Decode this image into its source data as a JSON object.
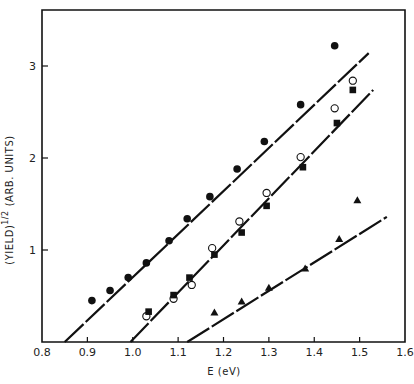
{
  "chart_data": {
    "type": "scatter",
    "title": "",
    "xlabel": "E (eV)",
    "ylabel": "(YIELD)^1/2 (ARB. UNITS)",
    "ylabel_main": "(YIELD)",
    "ylabel_sup": "1/2",
    "ylabel_units": "(ARB. UNITS)",
    "xlim": [
      0.8,
      1.6
    ],
    "ylim": [
      0,
      3.5
    ],
    "x_ticks": [
      "0.8",
      "0.9",
      "1.0",
      "1.1",
      "1.2",
      "1.3",
      "1.4",
      "1.5",
      "1.6"
    ],
    "y_ticks": [
      "1",
      "2",
      "3"
    ],
    "grid": false,
    "legend": "none",
    "series": [
      {
        "name": "filled circles",
        "marker": "filled-circle",
        "points": [
          [
            0.91,
            0.45
          ],
          [
            0.95,
            0.56
          ],
          [
            0.99,
            0.7
          ],
          [
            1.03,
            0.86
          ],
          [
            1.08,
            1.1
          ],
          [
            1.12,
            1.34
          ],
          [
            1.17,
            1.58
          ],
          [
            1.23,
            1.88
          ],
          [
            1.29,
            2.18
          ],
          [
            1.37,
            2.58
          ],
          [
            1.445,
            3.22
          ]
        ],
        "fit_line": [
          [
            0.85,
            0.0
          ],
          [
            1.52,
            3.14
          ]
        ]
      },
      {
        "name": "open circles",
        "marker": "open-circle",
        "points": [
          [
            1.03,
            0.28
          ],
          [
            1.09,
            0.47
          ],
          [
            1.13,
            0.62
          ],
          [
            1.175,
            1.02
          ],
          [
            1.235,
            1.31
          ],
          [
            1.295,
            1.62
          ],
          [
            1.37,
            2.01
          ],
          [
            1.445,
            2.54
          ],
          [
            1.485,
            2.84
          ]
        ],
        "fit_line": [
          [
            0.995,
            0.0
          ],
          [
            1.53,
            2.74
          ]
        ]
      },
      {
        "name": "filled squares",
        "marker": "filled-square",
        "points": [
          [
            1.035,
            0.33
          ],
          [
            1.09,
            0.51
          ],
          [
            1.125,
            0.7
          ],
          [
            1.18,
            0.95
          ],
          [
            1.24,
            1.19
          ],
          [
            1.295,
            1.48
          ],
          [
            1.375,
            1.9
          ],
          [
            1.45,
            2.38
          ],
          [
            1.485,
            2.74
          ]
        ],
        "fit_line": [
          [
            0.995,
            0.0
          ],
          [
            1.53,
            2.74
          ]
        ]
      },
      {
        "name": "filled triangles",
        "marker": "filled-triangle",
        "points": [
          [
            1.18,
            0.32
          ],
          [
            1.24,
            0.44
          ],
          [
            1.3,
            0.59
          ],
          [
            1.38,
            0.8
          ],
          [
            1.455,
            1.12
          ],
          [
            1.495,
            1.54
          ]
        ],
        "fit_line": [
          [
            1.12,
            0.0
          ],
          [
            1.56,
            1.36
          ]
        ]
      }
    ]
  },
  "colors": {
    "ink": "#111111",
    "background": "#ffffff"
  }
}
